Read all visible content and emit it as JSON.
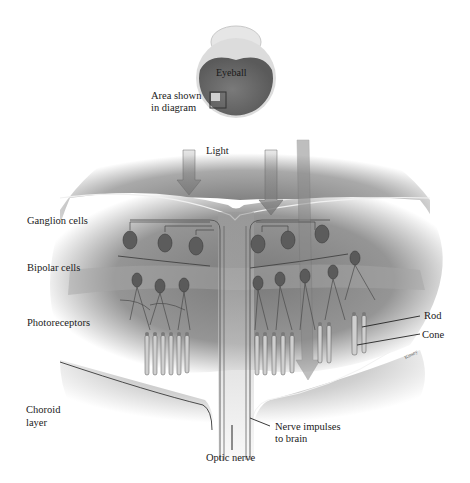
{
  "diagram": {
    "colors": {
      "background": "#ffffff",
      "tissue": "#8c8c8c",
      "tissue_light": "#bdbdbd",
      "eyeball": "#6e6e6e",
      "line": "#3a3a3a"
    },
    "inset": {
      "eyeball_label": "Eyeball",
      "area_label_line1": "Area shown",
      "area_label_line2": "in diagram"
    },
    "labels": {
      "light": "Light",
      "ganglion": "Ganglion cells",
      "bipolar": "Bipolar cells",
      "photoreceptors": "Photoreceptors",
      "choroid_line1": "Choroid",
      "choroid_line2": "layer",
      "rod": "Rod",
      "cone": "Cone",
      "nerve_line1": "Nerve impulses",
      "nerve_line2": "to brain",
      "optic_nerve": "Optic nerve",
      "artist": "Kinsey"
    }
  }
}
